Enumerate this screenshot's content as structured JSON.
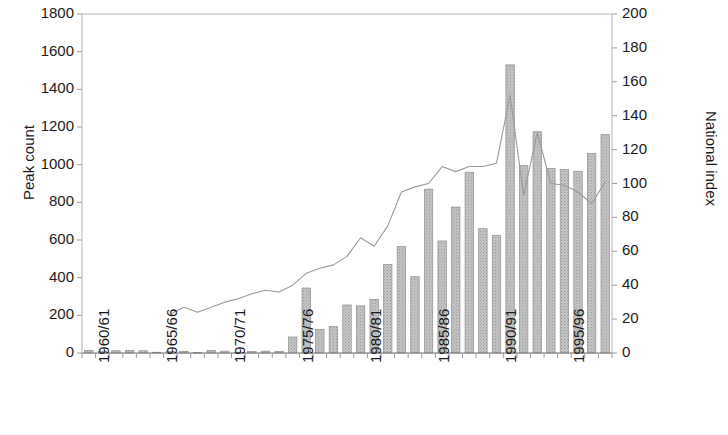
{
  "chart_data": {
    "type": "bar",
    "title": "",
    "subtitle": "",
    "xlabel": "",
    "ylabel": "Peak count",
    "y2label": "National index",
    "ylim": [
      0,
      1800
    ],
    "y2lim": [
      0,
      200
    ],
    "ytick_step": 200,
    "y2tick_step": 20,
    "yticks": [
      0,
      200,
      400,
      600,
      800,
      1000,
      1200,
      1400,
      1600,
      1800
    ],
    "y2ticks": [
      0,
      20,
      40,
      60,
      80,
      100,
      120,
      140,
      160,
      180,
      200
    ],
    "grid": false,
    "legend": "none",
    "legend_position": "none",
    "categories": [
      "1960/61",
      "1961/62",
      "1962/63",
      "1963/64",
      "1964/65",
      "1965/66",
      "1966/67",
      "1967/68",
      "1968/69",
      "1969/70",
      "1970/71",
      "1971/72",
      "1972/73",
      "1973/74",
      "1974/75",
      "1975/76",
      "1976/77",
      "1977/78",
      "1978/79",
      "1979/80",
      "1980/81",
      "1981/82",
      "1982/83",
      "1983/84",
      "1984/85",
      "1985/86",
      "1986/87",
      "1987/88",
      "1988/89",
      "1989/90",
      "1990/91",
      "1991/92",
      "1992/93",
      "1993/94",
      "1994/95",
      "1995/96",
      "1996/97",
      "1997/98",
      "1998/99"
    ],
    "xtick_labels_shown": [
      "1960/61",
      "1965/66",
      "1970/71",
      "1975/76",
      "1980/81",
      "1985/86",
      "1990/91",
      "1995/96"
    ],
    "series": [
      {
        "name": "Peak count",
        "type": "bar",
        "axis": "left",
        "color": "#b0b0b0",
        "values": [
          14,
          10,
          12,
          14,
          12,
          4,
          9,
          9,
          3,
          14,
          10,
          4,
          8,
          10,
          9,
          85,
          345,
          125,
          140,
          255,
          250,
          285,
          470,
          565,
          405,
          870,
          595,
          775,
          960,
          660,
          625,
          1530,
          995,
          1175,
          980,
          975,
          965,
          1060,
          1160
        ]
      },
      {
        "name": "National index",
        "type": "line",
        "axis": "right",
        "color": "#999999",
        "start_category": "1966/67",
        "values": [
          null,
          null,
          null,
          null,
          null,
          null,
          23,
          27,
          24,
          27,
          30,
          32,
          35,
          37,
          36,
          40,
          47,
          50,
          52,
          57,
          68,
          63,
          75,
          95,
          98,
          100,
          110,
          107,
          110,
          110,
          112,
          152,
          93,
          130,
          100,
          99,
          95,
          88,
          101
        ]
      }
    ],
    "extra_bars_note": "",
    "final_bars": [
      1520,
      1210
    ]
  },
  "axes": {
    "left_title": "Peak count",
    "right_title": "National index"
  }
}
